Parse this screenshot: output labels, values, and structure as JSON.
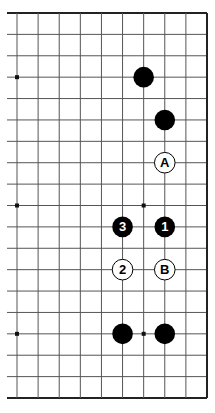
{
  "diagram": {
    "board": {
      "size": 19,
      "visible_columns": [
        9,
        18
      ],
      "visible_rows": [
        0,
        18
      ],
      "edges_shown": [
        "top",
        "right",
        "bottom"
      ],
      "line_color": "#555555",
      "edge_color": "#222222",
      "star_points": [
        [
          9,
          3
        ],
        [
          9,
          9
        ],
        [
          9,
          15
        ],
        [
          15,
          9
        ],
        [
          15,
          15
        ],
        [
          15,
          3
        ]
      ]
    },
    "stones": [
      {
        "color": "black",
        "col": 15,
        "row": 3,
        "label": ""
      },
      {
        "color": "black",
        "col": 16,
        "row": 5,
        "label": ""
      },
      {
        "color": "black",
        "col": 16,
        "row": 10,
        "label": "1"
      },
      {
        "color": "white",
        "col": 14,
        "row": 12,
        "label": "2"
      },
      {
        "color": "black",
        "col": 14,
        "row": 10,
        "label": "3"
      },
      {
        "color": "black",
        "col": 14,
        "row": 15,
        "label": ""
      },
      {
        "color": "black",
        "col": 16,
        "row": 15,
        "label": ""
      }
    ],
    "markers": [
      {
        "type": "letter",
        "col": 16,
        "row": 7,
        "label": "A"
      },
      {
        "type": "letter",
        "col": 16,
        "row": 12,
        "label": "B"
      }
    ],
    "colors": {
      "black_stone": "#000000",
      "white_stone": "#ffffff",
      "stone_outline": "#000000",
      "black_label": "#ffffff",
      "white_label": "#000000"
    }
  }
}
